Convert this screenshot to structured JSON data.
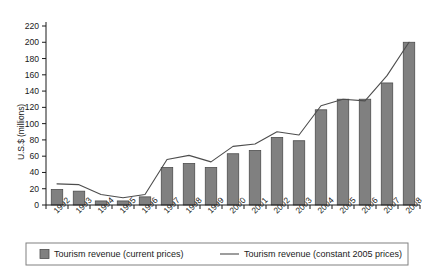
{
  "chart_data": {
    "type": "bar",
    "title": "",
    "xlabel": "",
    "ylabel": "U.S.$ (millions)",
    "ylim": [
      0,
      220
    ],
    "ytick_step": 20,
    "yticks": [
      0,
      20,
      40,
      60,
      80,
      100,
      120,
      140,
      160,
      180,
      200,
      220
    ],
    "grid": false,
    "legend_position": "bottom",
    "categories": [
      "1992",
      "1993",
      "1994",
      "1995",
      "1996",
      "1997",
      "1998",
      "1999",
      "2000",
      "2001",
      "2002",
      "2003",
      "2004",
      "2005",
      "2006",
      "2007",
      "2008"
    ],
    "series": [
      {
        "name": "Tourism revenue (current prices)",
        "type": "bar",
        "color": "#808080",
        "values": [
          19,
          17,
          5,
          5,
          10,
          46,
          51,
          46,
          63,
          67,
          83,
          79,
          117,
          130,
          130,
          150,
          200
        ]
      },
      {
        "name": "Tourism revenue (constant 2005 prices)",
        "type": "line",
        "color": "#4d4d4d",
        "values": [
          26,
          25,
          13,
          9,
          13,
          56,
          61,
          53,
          72,
          75,
          90,
          86,
          122,
          130,
          128,
          159,
          200
        ]
      }
    ]
  },
  "legend": {
    "items": [
      {
        "label": "Tourism revenue (current prices)",
        "marker": "swatch"
      },
      {
        "label": "Tourism revenue (constant 2005 prices)",
        "marker": "line"
      }
    ]
  },
  "colors": {
    "bar_fill": "#808080",
    "bar_stroke": "#4d4d4d",
    "line": "#4d4d4d",
    "axis": "#1a1a1a",
    "legend_border": "#808080",
    "background": "#ffffff"
  }
}
